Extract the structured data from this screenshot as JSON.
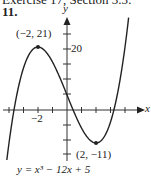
{
  "header": {
    "text": "Exercise 17, Section 3.3:"
  },
  "problem_number": "11.",
  "chart_data": {
    "type": "line",
    "title": "",
    "equation": "y = x³ − 12x + 5",
    "xlabel": "x",
    "ylabel": "y",
    "xlim": [
      -4.5,
      5.2
    ],
    "ylim": [
      -16,
      30
    ],
    "x_tick_spacing": 1,
    "y_tick_spacing": 5,
    "tick_labels": {
      "x": [
        "−2"
      ],
      "y": [
        "20"
      ]
    },
    "grid": false,
    "annotations": [
      {
        "label": "(−2, 21)",
        "x": -2,
        "y": 21,
        "kind": "local maximum"
      },
      {
        "label": "(2, −11)",
        "x": 2,
        "y": -11,
        "kind": "local minimum"
      }
    ],
    "series": [
      {
        "name": "y = x^3 - 12x + 5",
        "x": [
          -4.15,
          -4,
          -3.5,
          -3,
          -2.5,
          -2,
          -1.5,
          -1,
          -0.5,
          0,
          0.5,
          1,
          1.5,
          2,
          2.5,
          3,
          3.5,
          4,
          4.35
        ],
        "y": [
          -16.7,
          -11,
          4.1,
          14,
          19.4,
          21,
          19.6,
          16,
          10.9,
          5,
          -0.9,
          -6,
          -9.6,
          -11,
          -9.4,
          -4,
          5.9,
          21,
          35.1
        ]
      }
    ]
  },
  "labels": {
    "y_axis": "y",
    "x_axis": "x",
    "y_tick_20": "20",
    "x_tick_neg2": "−2",
    "max_point": "(−2, 21)",
    "min_point": "(2, −11)",
    "equation": "y = x³ − 12x + 5"
  }
}
